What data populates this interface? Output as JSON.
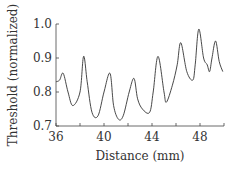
{
  "chart_data": {
    "type": "line",
    "title": "",
    "xlabel": "Distance (mm)",
    "ylabel": "Threshold (normalized)",
    "xlim": [
      36,
      50
    ],
    "ylim": [
      0.7,
      1.0
    ],
    "xticks": [
      36,
      40,
      44,
      48
    ],
    "xtick_labels": [
      "36",
      "40",
      "44",
      "48"
    ],
    "xminor_ticks": [
      38,
      42,
      46,
      50
    ],
    "yticks": [
      0.7,
      0.8,
      0.9,
      1.0
    ],
    "ytick_labels": [
      "0.7",
      "0.8",
      "0.9",
      "1.0"
    ],
    "grid": false,
    "legend": null,
    "line_color": "#333333",
    "series": [
      {
        "name": "threshold",
        "x": [
          36.0,
          36.3,
          36.6,
          37.0,
          37.4,
          38.0,
          38.3,
          38.6,
          39.0,
          39.5,
          40.0,
          40.5,
          40.8,
          41.2,
          41.6,
          42.1,
          42.5,
          42.8,
          43.2,
          43.8,
          44.1,
          44.5,
          45.0,
          45.2,
          45.7,
          46.1,
          46.4,
          46.9,
          47.4,
          47.6,
          47.9,
          48.3,
          48.6,
          48.8,
          49.0,
          49.3,
          49.6,
          49.9
        ],
        "y": [
          0.83,
          0.835,
          0.855,
          0.8,
          0.76,
          0.8,
          0.905,
          0.83,
          0.74,
          0.73,
          0.8,
          0.855,
          0.76,
          0.72,
          0.73,
          0.8,
          0.84,
          0.78,
          0.75,
          0.74,
          0.8,
          0.905,
          0.8,
          0.77,
          0.82,
          0.88,
          0.945,
          0.86,
          0.835,
          0.88,
          0.985,
          0.9,
          0.88,
          0.86,
          0.9,
          0.95,
          0.89,
          0.86
        ]
      }
    ]
  }
}
